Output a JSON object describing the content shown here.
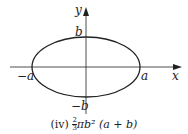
{
  "diagram": {
    "axes": {
      "x_label": "x",
      "y_label": "y"
    },
    "ellipse": {
      "semi_major_label": "a",
      "neg_semi_major_label": "−a",
      "semi_minor_label": "b",
      "neg_semi_minor_label": "−b"
    },
    "caption": {
      "prefix": "(iv) ",
      "frac_num": "2",
      "frac_den": "3",
      "expr": "πb² (a + b)"
    },
    "colors": {
      "stroke": "#222222",
      "background": "#ffffff"
    }
  }
}
